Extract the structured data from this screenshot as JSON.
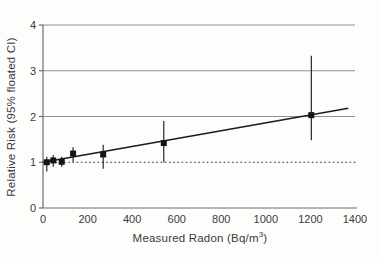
{
  "chart": {
    "ylabel": "Relative Risk (95% floated CI)",
    "xlabel_prefix": "Measured Radon (Bq/m",
    "xlabel_sup": "3",
    "xlabel_suffix": ")"
  },
  "chart_data": {
    "type": "scatter",
    "title": "",
    "xlabel": "Measured Radon (Bq/m3)",
    "ylabel": "Relative Risk (95% floated CI)",
    "xlim": [
      0,
      1400
    ],
    "ylim": [
      0,
      4
    ],
    "xticks": [
      0,
      200,
      400,
      600,
      800,
      1000,
      1200,
      1400
    ],
    "yticks": [
      0,
      1,
      2,
      3,
      4
    ],
    "gridlines_y": [
      2,
      3,
      4
    ],
    "grid": "horizontal-only",
    "legend": "none",
    "reference_line": {
      "y": 1,
      "style": "dotted"
    },
    "fit_line": {
      "x_start": 0,
      "y_start": 1.0,
      "x_end": 1370,
      "y_end": 2.18,
      "description": "linear excess relative risk trend"
    },
    "points": [
      {
        "x": 17,
        "y": 1.0,
        "ci_low": 0.8,
        "ci_high": 1.12
      },
      {
        "x": 46,
        "y": 1.04,
        "ci_low": 0.9,
        "ci_high": 1.16
      },
      {
        "x": 84,
        "y": 1.01,
        "ci_low": 0.9,
        "ci_high": 1.12
      },
      {
        "x": 135,
        "y": 1.19,
        "ci_low": 1.01,
        "ci_high": 1.33
      },
      {
        "x": 270,
        "y": 1.17,
        "ci_low": 0.86,
        "ci_high": 1.38
      },
      {
        "x": 542,
        "y": 1.42,
        "ci_low": 1.0,
        "ci_high": 1.9
      },
      {
        "x": 1204,
        "y": 2.03,
        "ci_low": 1.48,
        "ci_high": 3.33
      }
    ],
    "colors": {
      "point": "#141414",
      "fit_line": "#1c1c1c",
      "reference_line": "#2a2a2a",
      "grid": "#8f8f8f",
      "axis": "#6d6d6d",
      "text": "#3a3a3a"
    }
  }
}
